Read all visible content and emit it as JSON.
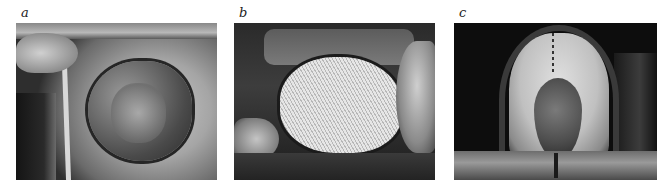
{
  "figure": {
    "panels": [
      {
        "label": "a",
        "description": "Chest wall defect with exposed wound bed"
      },
      {
        "label": "b",
        "description": "Mesh patch sutured over defect"
      },
      {
        "label": "c",
        "description": "Flap coverage with midline suture"
      }
    ]
  }
}
